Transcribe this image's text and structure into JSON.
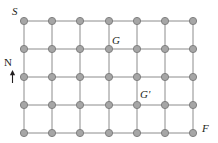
{
  "figure": {
    "background_color": "#ffffff",
    "width": 218,
    "height": 143
  },
  "style": {
    "node_fill": "#a6a6a6",
    "node_stroke": "#808080",
    "node_radius": 3.6,
    "edge_color": "#8c8c8c",
    "edge_width": 1,
    "label_color": "#231f20",
    "compass_color": "#231f20"
  },
  "grid": {
    "columns": 7,
    "rows": 5,
    "x_positions": [
      24,
      52,
      80,
      109,
      137,
      165,
      193
    ],
    "y_positions": [
      21,
      49,
      77,
      105,
      133
    ],
    "node_count": 35,
    "edge_count": 65
  },
  "labels": [
    {
      "id": "S",
      "text": "S",
      "name": "start-node-label",
      "col": 0,
      "row": 0
    },
    {
      "id": "G",
      "text": "G",
      "name": "goal-node-label",
      "col": 3,
      "row": 1
    },
    {
      "id": "Gp",
      "text": "G'",
      "name": "goal-prime-node-label",
      "col": 4,
      "row": 3
    },
    {
      "id": "F",
      "text": "F",
      "name": "finish-node-label",
      "col": 6,
      "row": 4
    }
  ],
  "compass": {
    "letter": "N",
    "direction": "up",
    "name": "north-compass-indicator"
  },
  "chart_data": {
    "type": "scatter",
    "title": "",
    "xlabel": "",
    "ylabel": "",
    "grid": true,
    "legend": "none",
    "x": [
      24,
      52,
      80,
      109,
      137,
      165,
      193
    ],
    "y": [
      21,
      49,
      77,
      105,
      133
    ],
    "xlim": [
      24,
      193
    ],
    "ylim": [
      21,
      133
    ],
    "annotations": [
      "S",
      "G",
      "G'",
      "F",
      "N"
    ]
  }
}
